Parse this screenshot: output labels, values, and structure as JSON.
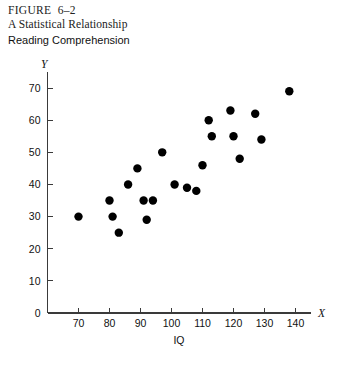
{
  "figure": {
    "number": "FIGURE  6–2",
    "title": "A Statistical Relationship",
    "subtitle": "Reading Comprehension"
  },
  "chart_data": {
    "type": "scatter",
    "title": "A Statistical Relationship",
    "subtitle": "Reading Comprehension",
    "xlabel": "IQ",
    "ylabel": "Reading Comprehension",
    "x_axis_symbol": "X",
    "y_axis_symbol": "Y",
    "xlim": [
      60,
      145
    ],
    "ylim": [
      0,
      75
    ],
    "xticks": [
      70,
      80,
      90,
      100,
      110,
      120,
      130,
      140
    ],
    "xticklabels": [
      "70",
      "80",
      "90",
      "100",
      "110",
      "120",
      "130",
      "140"
    ],
    "yticks": [
      0,
      10,
      20,
      30,
      40,
      50,
      60,
      70
    ],
    "yticklabels": [
      "0",
      "10",
      "20",
      "30",
      "40",
      "50",
      "60",
      "70"
    ],
    "grid": false,
    "legend": false,
    "marker": "filled-circle",
    "marker_color": "#000000",
    "marker_size_px": 4.2,
    "n_points": 22,
    "points": [
      {
        "x": 70,
        "y": 30
      },
      {
        "x": 80,
        "y": 35
      },
      {
        "x": 81,
        "y": 30
      },
      {
        "x": 83,
        "y": 25
      },
      {
        "x": 86,
        "y": 40
      },
      {
        "x": 89,
        "y": 45
      },
      {
        "x": 91,
        "y": 35
      },
      {
        "x": 92,
        "y": 29
      },
      {
        "x": 94,
        "y": 35
      },
      {
        "x": 97,
        "y": 50
      },
      {
        "x": 101,
        "y": 40
      },
      {
        "x": 105,
        "y": 39
      },
      {
        "x": 108,
        "y": 38
      },
      {
        "x": 110,
        "y": 46
      },
      {
        "x": 112,
        "y": 60
      },
      {
        "x": 113,
        "y": 55
      },
      {
        "x": 119,
        "y": 63
      },
      {
        "x": 120,
        "y": 55
      },
      {
        "x": 122,
        "y": 48
      },
      {
        "x": 127,
        "y": 62
      },
      {
        "x": 129,
        "y": 54
      },
      {
        "x": 138,
        "y": 69
      }
    ]
  }
}
